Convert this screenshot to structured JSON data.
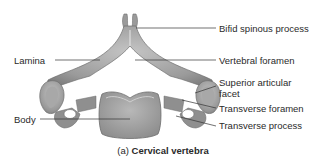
{
  "diagram": {
    "labels": {
      "bifid_spinous_process": "Bifid spinous process",
      "vertebral_foramen": "Vertebral foramen",
      "superior_articular_facet_line1": "Superior articular",
      "superior_articular_facet_line2": "facet",
      "transverse_foramen": "Transverse foramen",
      "transverse_process": "Transverse process",
      "lamina": "Lamina",
      "body": "Body"
    },
    "caption": {
      "prefix": "(a)",
      "title": "Cervical vertebra"
    },
    "colors": {
      "bone": "#8f8f8f",
      "bone_light": "#b9b9b9",
      "bone_dark": "#6e6e6e",
      "leader_line": "#333333"
    }
  }
}
